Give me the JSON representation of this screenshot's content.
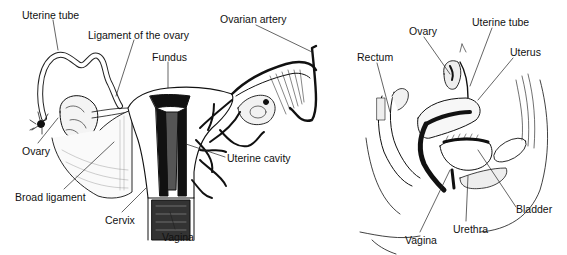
{
  "figure": {
    "left_panel": {
      "view": "anterior view of uterus, tubes and ovaries",
      "labels": [
        {
          "id": "uterine-tube",
          "text": "Uterine tube",
          "x": 22,
          "y": 9
        },
        {
          "id": "ligament-of-ovary",
          "text": "Ligament of the ovary",
          "x": 88,
          "y": 29
        },
        {
          "id": "fundus",
          "text": "Fundus",
          "x": 152,
          "y": 51
        },
        {
          "id": "ovarian-artery",
          "text": "Ovarian artery",
          "x": 220,
          "y": 13
        },
        {
          "id": "ovary",
          "text": "Ovary",
          "x": 22,
          "y": 145
        },
        {
          "id": "uterine-cavity",
          "text": "Uterine cavity",
          "x": 227,
          "y": 152
        },
        {
          "id": "broad-ligament",
          "text": "Broad ligament",
          "x": 15,
          "y": 191
        },
        {
          "id": "cervix",
          "text": "Cervix",
          "x": 105,
          "y": 214
        },
        {
          "id": "vagina",
          "text": "Vagina",
          "x": 162,
          "y": 231
        }
      ]
    },
    "right_panel": {
      "view": "sagittal section of female pelvis",
      "labels": [
        {
          "id": "ovary",
          "text": "Ovary",
          "x": 409,
          "y": 25
        },
        {
          "id": "uterine-tube",
          "text": "Uterine tube",
          "x": 472,
          "y": 16
        },
        {
          "id": "rectum",
          "text": "Rectum",
          "x": 357,
          "y": 51
        },
        {
          "id": "uterus",
          "text": "Uterus",
          "x": 510,
          "y": 46
        },
        {
          "id": "bladder",
          "text": "Bladder",
          "x": 516,
          "y": 203
        },
        {
          "id": "urethra",
          "text": "Urethra",
          "x": 453,
          "y": 223
        },
        {
          "id": "vagina",
          "text": "Vagina",
          "x": 405,
          "y": 234
        }
      ]
    }
  }
}
